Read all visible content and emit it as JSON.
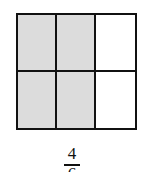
{
  "diagram": {
    "type": "fraction-area-model",
    "rows": 2,
    "columns": 3,
    "cells": [
      {
        "row": 1,
        "col": 1,
        "shaded": true
      },
      {
        "row": 1,
        "col": 2,
        "shaded": true
      },
      {
        "row": 1,
        "col": 3,
        "shaded": false
      },
      {
        "row": 2,
        "col": 1,
        "shaded": true
      },
      {
        "row": 2,
        "col": 2,
        "shaded": true
      },
      {
        "row": 2,
        "col": 3,
        "shaded": false
      }
    ],
    "colors": {
      "shaded": "#dcdcdc",
      "unshaded": "#ffffff",
      "border": "#111111"
    }
  },
  "fraction": {
    "numerator": "4",
    "denominator": "6"
  }
}
